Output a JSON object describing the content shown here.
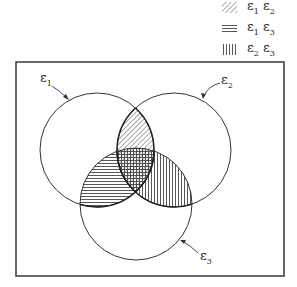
{
  "diagram": {
    "type": "venn",
    "sets": [
      {
        "id": "E1",
        "symbol": "ε",
        "subscript": "1",
        "cx": 97,
        "cy": 150,
        "r": 57
      },
      {
        "id": "E2",
        "symbol": "ε",
        "subscript": "2",
        "cx": 174,
        "cy": 150,
        "r": 57
      },
      {
        "id": "E3",
        "symbol": "ε",
        "subscript": "3",
        "cx": 136,
        "cy": 204,
        "r": 56
      }
    ],
    "frame": {
      "x": 16,
      "y": 62,
      "width": 268,
      "height": 214
    },
    "colors": {
      "stroke": "#333333",
      "background": "#ffffff"
    }
  },
  "legend": {
    "items": [
      {
        "pattern": "diagonal",
        "symbol1": "ε",
        "sub1": "1",
        "symbol2": "ε",
        "sub2": "2",
        "text": "ε1 ε2"
      },
      {
        "pattern": "horizontal",
        "symbol1": "ε",
        "sub1": "1",
        "symbol2": "ε",
        "sub2": "3",
        "text": "ε1 ε3"
      },
      {
        "pattern": "vertical",
        "symbol1": "ε",
        "sub1": "2",
        "symbol2": "ε",
        "sub2": "3",
        "text": "ε2 ε3"
      }
    ]
  },
  "labels": {
    "e1": {
      "symbol": "ε",
      "sub": "1"
    },
    "e2": {
      "symbol": "ε",
      "sub": "2"
    },
    "e3": {
      "symbol": "ε",
      "sub": "3"
    }
  }
}
